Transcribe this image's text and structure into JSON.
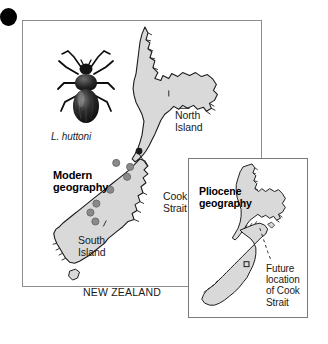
{
  "figure": {
    "bullet_marker": "filled-circle",
    "background_color": "#ffffff"
  },
  "colors": {
    "land_fill": "#d9d9d9",
    "land_stroke": "#1a1a1a",
    "locality_dot": "#8a8a8a",
    "locality_dot_stroke": "#5a5a5a",
    "cook_strait_marker": "#1a1a1a",
    "panel_border": "#8d8d8d",
    "text": "#1a1a1a",
    "beetle": "#111111"
  },
  "main_panel": {
    "title": "Modern\ngeography",
    "country_label": "NEW ZEALAND",
    "specimen": {
      "name": "L. huttoni",
      "icon": "beetle-illustration"
    },
    "labels": {
      "north_island": "North\nIsland",
      "south_island": "South\nIsland",
      "cook_strait": "Cook\nStrait"
    },
    "locality_dots": [
      {
        "cx": 108,
        "cy": 164,
        "r": 3.6
      },
      {
        "cx": 96,
        "cy": 160,
        "r": 3.6
      },
      {
        "cx": 107,
        "cy": 174,
        "r": 3.6
      },
      {
        "cx": 90,
        "cy": 186,
        "r": 3.6
      },
      {
        "cx": 78,
        "cy": 199,
        "r": 3.6
      },
      {
        "cx": 73,
        "cy": 207,
        "r": 3.6
      },
      {
        "cx": 78,
        "cy": 215,
        "r": 3.6
      }
    ],
    "cook_strait_marker": {
      "cx": 138,
      "cy": 150,
      "r": 3.2
    }
  },
  "inset_panel": {
    "title": "Pliocene\ngeography",
    "annotation": "Future\nlocation\nof Cook\nStrait",
    "future_marker": "small-square"
  }
}
